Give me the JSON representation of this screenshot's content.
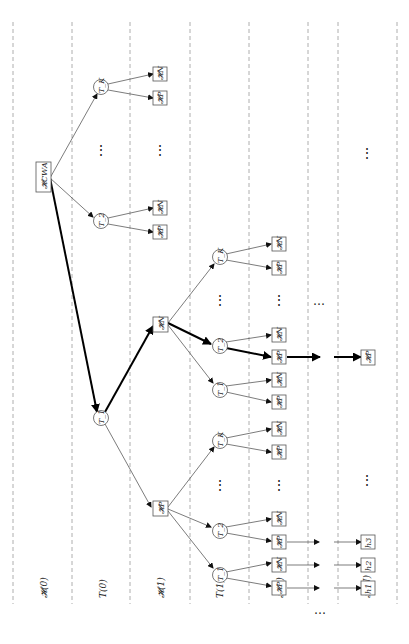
{
  "figure": {
    "orientation": "rotated -90deg (tree grows left to right)",
    "columns": [
      {
        "label": "𝓗(0)",
        "x": 44
      },
      {
        "label": "T(0)",
        "x": 103
      },
      {
        "label": "𝓗(1)",
        "x": 161
      },
      {
        "label": "T(1)",
        "x": 220
      },
      {
        "label": "𝓗(2)",
        "x": 280
      },
      {
        "label": "…",
        "x": 323
      },
      {
        "label": "𝓗(N)",
        "x": 367
      }
    ],
    "root": {
      "label": "𝓗CWA"
    },
    "t0_nodes": {
      "top": "T_K",
      "mid": "T_2",
      "bottom": "T_1"
    },
    "h1_nodes": {
      "n": "𝓗N",
      "p": "𝓗P"
    },
    "t1_nodes": {
      "k": "T_K",
      "two": "T_2",
      "one": "T_1"
    },
    "leaf_labels": {
      "n": "𝓗N",
      "p": "𝓗P"
    },
    "final_leaves": {
      "h1": "h1",
      "h2": "h2",
      "h3": "h3",
      "hp": "𝓗P"
    },
    "ellipsis": "⋮",
    "hellipsis": "…"
  }
}
